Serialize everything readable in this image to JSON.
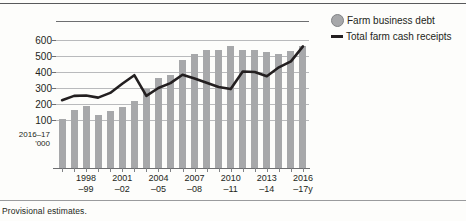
{
  "footnote": "Provisional estimates.",
  "legend": {
    "items": [
      {
        "label": "Farm business debt",
        "marker": "circle",
        "color": "#a7a8aa"
      },
      {
        "label": "Total farm cash receipts",
        "marker": "line",
        "color": "#231f20"
      }
    ]
  },
  "axis": {
    "unit_line1": "2016–17",
    "unit_line2": "'000",
    "y_ticks": [
      "600",
      "500",
      "400",
      "300",
      "200",
      "100"
    ],
    "x_ticks": [
      {
        "line1": "1998",
        "line2": "–99"
      },
      {
        "line1": "2001",
        "line2": "–02"
      },
      {
        "line1": "2004",
        "line2": "–05"
      },
      {
        "line1": "2007",
        "line2": "–08"
      },
      {
        "line1": "2010",
        "line2": "–11"
      },
      {
        "line1": "2013",
        "line2": "–14"
      },
      {
        "line1": "2016",
        "line2": "–17y"
      }
    ]
  },
  "chart_data": {
    "type": "bar",
    "title": "",
    "xlabel": "",
    "ylabel": "2016–17 '000",
    "ylim": [
      0,
      600
    ],
    "grid": true,
    "legend_position": "right",
    "categories": [
      "1996–97",
      "1997–98",
      "1998–99",
      "1999–2000",
      "2000–01",
      "2001–02",
      "2002–03",
      "2003–04",
      "2004–05",
      "2005–06",
      "2006–07",
      "2007–08",
      "2008–09",
      "2009–10",
      "2010–11",
      "2011–12",
      "2012–13",
      "2013–14",
      "2014–15",
      "2015–16",
      "2016–17y"
    ],
    "series": [
      {
        "name": "Farm business debt",
        "type": "bar",
        "color": "#a7a8aa",
        "values": [
          230,
          272,
          290,
          250,
          265,
          288,
          312,
          370,
          420,
          435,
          508,
          535,
          552,
          555,
          572,
          555,
          552,
          545,
          535,
          550,
          570
        ]
      },
      {
        "name": "Total farm cash receipts",
        "type": "line",
        "color": "#231f20",
        "values": [
          318,
          338,
          340,
          330,
          352,
          395,
          435,
          338,
          375,
          398,
          437,
          420,
          400,
          380,
          370,
          452,
          450,
          430,
          472,
          500,
          570
        ]
      }
    ]
  }
}
